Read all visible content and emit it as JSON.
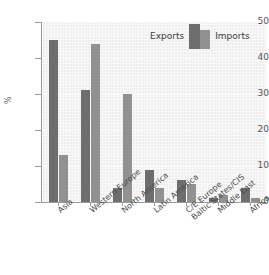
{
  "chart_data": {
    "type": "bar",
    "title": "",
    "subtitle": "",
    "xlabel": "",
    "ylabel": "%",
    "ylim": [
      0,
      50
    ],
    "yticks": [
      "0",
      "10",
      "20",
      "30",
      "40",
      "50"
    ],
    "ytick_values": [
      0,
      10,
      20,
      30,
      40,
      50
    ],
    "grid": true,
    "legend_position": "top-right",
    "categories": [
      "Asia",
      "Western Europe",
      "North America",
      "Latin America",
      "C/E Europe\nBaltic States/CIS",
      "Middle East",
      "Africa"
    ],
    "category_lines": [
      [
        "Asia"
      ],
      [
        "Western Europe"
      ],
      [
        "North America"
      ],
      [
        "Latin America"
      ],
      [
        "C/E Europe",
        "Baltic States/CIS"
      ],
      [
        "Middle East"
      ],
      [
        "Africa"
      ]
    ],
    "series": [
      {
        "name": "Exports",
        "color": "#6e6e6e",
        "values": [
          45,
          31,
          4,
          9,
          6,
          1,
          4
        ]
      },
      {
        "name": "Imports",
        "color": "#919191",
        "values": [
          13,
          44,
          30,
          4,
          5,
          2,
          1
        ]
      }
    ]
  },
  "legend": {
    "exports_label": "Exports",
    "imports_label": "Imports"
  },
  "colors": {
    "exports": "#6e6e6e",
    "imports": "#919191",
    "plot_background": "#efefef",
    "page_background": "#ffffff",
    "axis": "#9a9a9a",
    "gridline": "#f8f8f8",
    "tick_text": "#555555",
    "label_text": "#4a4a4a"
  }
}
